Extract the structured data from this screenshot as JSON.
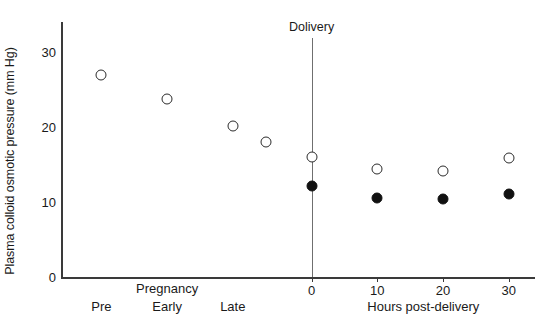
{
  "chart_data": {
    "type": "scatter",
    "title": "",
    "xlabel": "Hours post-delivery",
    "ylabel": "Plasma colloid osmotic pressure (mm Hg)",
    "ylim": [
      0,
      34
    ],
    "yticks": [
      0,
      10,
      20,
      30
    ],
    "ytick_labels": [
      "0",
      "10",
      "20",
      "30"
    ],
    "xticks": [
      0,
      10,
      20,
      30
    ],
    "xtick_labels": [
      "0",
      "10",
      "20",
      "30"
    ],
    "xlim": [
      -38,
      34
    ],
    "grid": false,
    "legend": "none",
    "annotations": [
      {
        "text": "Dolivery",
        "x": 0,
        "type": "vline-label"
      }
    ],
    "category_axis": {
      "group_label": "Pregnancy",
      "categories": [
        {
          "label": "Pre",
          "x": -32
        },
        {
          "label": "Early",
          "x": -22
        },
        {
          "label": "Late",
          "x": -12
        }
      ]
    },
    "series": [
      {
        "name": "open-circles",
        "marker": "open-circle",
        "points": [
          {
            "x": -32,
            "y": 27.0
          },
          {
            "x": -22,
            "y": 23.7
          },
          {
            "x": -12,
            "y": 20.2
          },
          {
            "x": -7,
            "y": 18.0
          },
          {
            "x": 0,
            "y": 16.0
          },
          {
            "x": 10,
            "y": 14.4
          },
          {
            "x": 20,
            "y": 14.2
          },
          {
            "x": 30,
            "y": 15.9
          }
        ]
      },
      {
        "name": "filled-circles",
        "marker": "filled-circle",
        "points": [
          {
            "x": 0,
            "y": 12.2
          },
          {
            "x": 10,
            "y": 10.6
          },
          {
            "x": 20,
            "y": 10.4
          },
          {
            "x": 30,
            "y": 11.1
          }
        ]
      }
    ]
  },
  "colors": {
    "axis": "#3a3a3a",
    "text": "#1a1a1a",
    "marker_open_edge": "#2b2b2b",
    "marker_filled": "#111111",
    "event_line": "#6f6f6f",
    "background": "#ffffff"
  }
}
